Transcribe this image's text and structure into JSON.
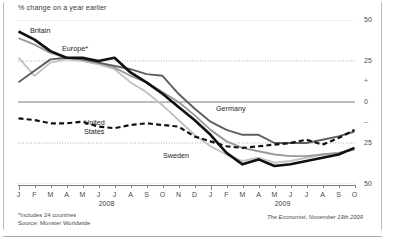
{
  "figure": {
    "title": "% change on a year earlier",
    "footnote_1": "*Includes 24 countries",
    "footnote_2": "Source: Monster Worldwide",
    "credit": "The Economist, November 19th 2009"
  },
  "axis": {
    "y_labels": [
      "50",
      "25",
      "+",
      "0",
      "–",
      "25",
      "50"
    ],
    "y_values": [
      50,
      25,
      null,
      0,
      null,
      -25,
      -50
    ],
    "x_month_letters": [
      "J",
      "F",
      "M",
      "A",
      "M",
      "J",
      "J",
      "A",
      "S",
      "O",
      "N",
      "D",
      "J",
      "F",
      "M",
      "A",
      "M",
      "J",
      "J",
      "A",
      "S",
      "O"
    ],
    "x_year_labels": [
      "2008",
      "2009"
    ]
  },
  "legend": {
    "britain": "Britain",
    "europe": "Europe*",
    "germany": "Germany",
    "united_states_line1": "United",
    "united_states_line2": "States",
    "sweden": "Sweden"
  },
  "colors": {
    "britain": "#101010",
    "europe": "#9a9a9a",
    "germany": "#5e5e5e",
    "united_states": "#111111",
    "sweden": "#c3c3c3",
    "zero_line": "#7d7d7d",
    "grid": "#8a8a8a",
    "axis_text": "#4a4a4a",
    "background": "#ffffff"
  },
  "chart_data": {
    "type": "line",
    "title": "% change on a year earlier",
    "subtitle": "",
    "xlabel": "",
    "ylabel": "% change on a year earlier",
    "ylim": [
      -50,
      50
    ],
    "yticks": [
      50,
      25,
      0,
      -25,
      -50
    ],
    "grid": true,
    "grid_style": "dotted horizontal, solid zero line",
    "legend": "direct labels on lines",
    "x": [
      "Jan 2008",
      "Feb 2008",
      "Mar 2008",
      "Apr 2008",
      "May 2008",
      "Jun 2008",
      "Jul 2008",
      "Aug 2008",
      "Sep 2008",
      "Oct 2008",
      "Nov 2008",
      "Dec 2008",
      "Jan 2009",
      "Feb 2009",
      "Mar 2009",
      "Apr 2009",
      "May 2009",
      "Jun 2009",
      "Jul 2009",
      "Aug 2009",
      "Sep 2009",
      "Oct 2009"
    ],
    "series": [
      {
        "name": "Britain",
        "color": "#101010",
        "style": "solid-thick",
        "values": [
          43,
          38,
          31,
          27,
          27,
          25,
          27,
          18,
          12,
          5,
          -3,
          -11,
          -20,
          -31,
          -38,
          -35,
          -39,
          -38,
          -36,
          -34,
          -32,
          -28
        ]
      },
      {
        "name": "Europe*",
        "color": "#9a9a9a",
        "style": "solid",
        "values": [
          39,
          35,
          30,
          27,
          26,
          24,
          21,
          16,
          12,
          6,
          0,
          -8,
          -17,
          -24,
          -28,
          -30,
          -32,
          -33,
          -33,
          -32,
          -31,
          -29
        ]
      },
      {
        "name": "Germany",
        "color": "#5e5e5e",
        "style": "solid",
        "values": [
          12,
          19,
          26,
          27,
          26,
          24,
          22,
          20,
          17,
          16,
          5,
          -4,
          -12,
          -17,
          -20,
          -20,
          -25,
          -25,
          -25,
          -23,
          -21,
          -18
        ]
      },
      {
        "name": "United States",
        "color": "#111111",
        "style": "dashed",
        "values": [
          -10,
          -11,
          -13,
          -13,
          -12,
          -15,
          -16,
          -14,
          -13,
          -14,
          -15,
          -21,
          -24,
          -27,
          -28,
          -27,
          -26,
          -25,
          -23,
          -26,
          -22,
          -17
        ]
      },
      {
        "name": "Sweden",
        "color": "#c3c3c3",
        "style": "solid",
        "values": [
          27,
          16,
          24,
          26,
          25,
          23,
          20,
          12,
          6,
          -2,
          -11,
          -20,
          -27,
          -32,
          -36,
          -34,
          -37,
          -36,
          -34,
          -32,
          -31,
          -29
        ]
      }
    ]
  }
}
